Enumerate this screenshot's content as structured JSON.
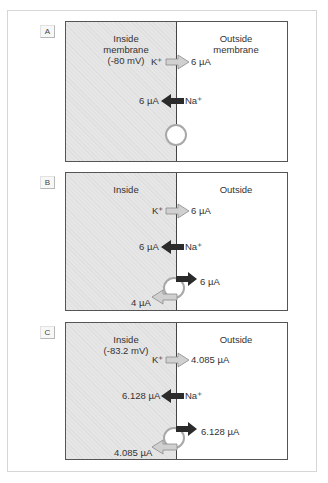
{
  "panels": [
    {
      "label": "A",
      "inside_title": "Inside",
      "inside_sub1": "membrane",
      "inside_sub2": "(-80 mV)",
      "outside_title": "Outside",
      "outside_sub1": "membrane",
      "k_ion": "K⁺",
      "k_current": "6 µA",
      "na_ion": "Na⁺",
      "na_current": "6 µA"
    },
    {
      "label": "B",
      "inside_title": "Inside",
      "outside_title": "Outside",
      "k_ion": "K⁺",
      "k_current": "6 µA",
      "na_ion": "Na⁺",
      "na_current": "6 µA",
      "pump_out_current": "6 µA",
      "pump_in_current": "4 µA"
    },
    {
      "label": "C",
      "inside_title": "Inside",
      "inside_sub1": "(-83.2 mV)",
      "outside_title": "Outside",
      "k_ion": "K⁺",
      "k_current": "4.085 µA",
      "na_ion": "Na⁺",
      "na_current": "6.128 µA",
      "pump_out_current": "6.128 µA",
      "pump_in_current": "4.085 µA"
    }
  ],
  "colors": {
    "inside_fill": "#e6e6e6",
    "na_arrow": "#2b2b2b",
    "k_arrow_fill": "#d0d0d0",
    "pump_circle": "#a8a8a8"
  }
}
